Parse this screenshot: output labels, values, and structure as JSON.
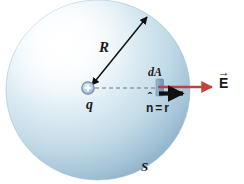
{
  "figure": {
    "canvas": {
      "width": 244,
      "height": 184,
      "background": "#ffffff"
    }
  },
  "labels": {
    "radius": "R",
    "area_element": "dA",
    "charge": "q",
    "normal_unit_vector": "n",
    "equals": "=",
    "radial_unit_vector": "r",
    "electric_field": "E",
    "surface": "S"
  },
  "sphere": {
    "name": "gaussian-surface-sphere",
    "center_x": 98,
    "center_y": 90,
    "radius_x": 92,
    "radius_y": 90,
    "highlight_color": "#fbfdfe",
    "mid_color": "#d6e8f0",
    "edge_color": "#8fb4cb",
    "shadow_color": "#7ea5bd"
  },
  "charge_marker": {
    "name": "point-charge-marker",
    "x": 88,
    "y": 88,
    "radius": 6,
    "sign": "+",
    "fill": "#b8cfe4",
    "stroke": "#6b86a8"
  },
  "area_patch": {
    "name": "area-element-patch",
    "x": 156,
    "y": 80,
    "width": 7,
    "height": 16,
    "fill": "#8fb2c8",
    "stroke": "#5d7f97"
  },
  "arrows": {
    "radius_arrow": {
      "name": "radius-double-arrow",
      "x1": 92,
      "y1": 85,
      "x2": 146,
      "y2": 18,
      "color": "#111111",
      "double_headed": true
    },
    "radial_dashed_line": {
      "name": "radial-dashed-line",
      "x1": 95,
      "y1": 88,
      "x2": 156,
      "y2": 88,
      "color": "#66737d",
      "dash": "4 3"
    },
    "efield_arrow": {
      "name": "electric-field-arrow",
      "x1": 158,
      "y1": 87,
      "x2": 214,
      "y2": 87,
      "color": "#c1423c"
    },
    "normal_arrow": {
      "name": "normal-unit-vector-arrow",
      "x1": 158,
      "y1": 94,
      "x2": 187,
      "y2": 94,
      "color": "#101010"
    }
  },
  "colors": {
    "red_accent": "#c1423c",
    "black": "#101010",
    "sphere_blue": "#a9c6d8",
    "page_background": "#ffffff"
  }
}
